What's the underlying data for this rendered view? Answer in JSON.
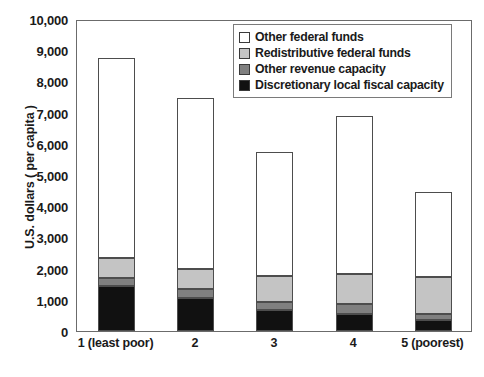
{
  "chart_data": {
    "type": "bar",
    "subtype": "stacked-vertical",
    "title": "",
    "subtitle": "",
    "xlabel": "",
    "ylabel": "U.S. dollars ( per capita )",
    "ylim": [
      0,
      10000
    ],
    "ytick_step": 1000,
    "grid": false,
    "legend_position": "top-right",
    "categories": [
      "1 (least poor)",
      "2",
      "3",
      "4",
      "5 (poorest)"
    ],
    "ytick_labels": [
      "10,000",
      "9,000",
      "8,000",
      "7,000",
      "6,000",
      "5,000",
      "4,000",
      "3,000",
      "2,000",
      "1,000",
      "0"
    ],
    "ytick_values": [
      10000,
      9000,
      8000,
      7000,
      6000,
      5000,
      4000,
      3000,
      2000,
      1000,
      0
    ],
    "series": [
      {
        "name": "Discretionary local fiscal capacity",
        "color": "#111111",
        "values": [
          1450,
          1050,
          680,
          530,
          350
        ]
      },
      {
        "name": "Other revenue capacity",
        "color": "#808080",
        "values": [
          250,
          300,
          240,
          350,
          210
        ]
      },
      {
        "name": "Redistributive federal funds",
        "color": "#c4c4c4",
        "values": [
          650,
          630,
          830,
          940,
          1170
        ]
      },
      {
        "name": "Other federal funds",
        "color": "#ffffff",
        "values": [
          6400,
          5500,
          4000,
          5080,
          2740
        ]
      }
    ],
    "stack_order_bottom_to_top": [
      "Discretionary local fiscal capacity",
      "Other revenue capacity",
      "Redistributive federal funds",
      "Other federal funds"
    ],
    "cumulative_tops": [
      [
        1450,
        1700,
        2350,
        8750
      ],
      [
        1050,
        1350,
        1980,
        7480
      ],
      [
        680,
        920,
        1750,
        5750
      ],
      [
        530,
        880,
        1820,
        6900
      ],
      [
        350,
        560,
        1730,
        4470
      ]
    ],
    "totals": [
      8750,
      7480,
      5750,
      6900,
      4470
    ]
  },
  "legend": {
    "entries": [
      {
        "label": "Other federal funds",
        "color": "#ffffff"
      },
      {
        "label": "Redistributive federal funds",
        "color": "#c4c4c4"
      },
      {
        "label": "Other revenue capacity",
        "color": "#808080"
      },
      {
        "label": "Discretionary local fiscal capacity",
        "color": "#111111"
      }
    ]
  },
  "colors": {
    "axis": "#6b6b6b",
    "bar_outline": "#4d4d4d",
    "text": "#1a1a1a",
    "background": "#ffffff"
  }
}
